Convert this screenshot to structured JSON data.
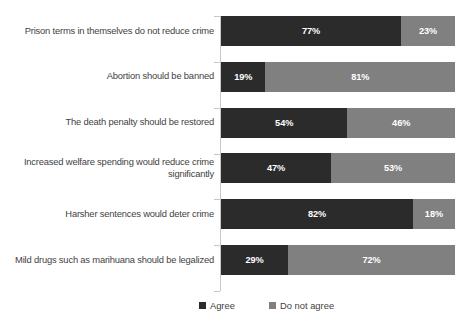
{
  "chart_data": {
    "type": "bar",
    "orientation": "horizontal",
    "stacked": true,
    "normalized_percent": true,
    "title": "",
    "subtitle": "",
    "xlabel": "",
    "ylabel": "",
    "xlim": [
      0,
      100
    ],
    "grid": false,
    "legend_position": "bottom",
    "categories": [
      "Prison terms in themselves do not reduce crime",
      "Abortion should be banned",
      "The death penalty should be restored",
      "Increased welfare spending would reduce crime significantly",
      "Harsher sentences would deter crime",
      "Mild drugs such as marihuana should be legalized"
    ],
    "series": [
      {
        "name": "Agree",
        "color": "#2b2b2b",
        "values": [
          77,
          19,
          54,
          47,
          82,
          29
        ],
        "labels": [
          "77%",
          "19%",
          "54%",
          "47%",
          "82%",
          "29%"
        ]
      },
      {
        "name": "Do not agree",
        "color": "#808080",
        "values": [
          23,
          81,
          46,
          53,
          18,
          72
        ],
        "labels": [
          "23%",
          "81%",
          "46%",
          "53%",
          "18%",
          "72%"
        ]
      }
    ],
    "legend": [
      "Agree",
      "Do not agree"
    ],
    "axis_color": "#c8c8c8",
    "data_label_color": "#ffffff"
  }
}
